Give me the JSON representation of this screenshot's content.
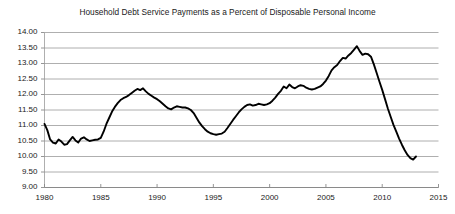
{
  "chart_data": {
    "type": "line",
    "title": "Household Debt Service Payments as a Percent of Disposable Personal Income",
    "xlabel": "",
    "ylabel": "",
    "xlim": [
      1980,
      2015
    ],
    "ylim": [
      9.0,
      14.0
    ],
    "grid": true,
    "legend": "none",
    "yticks": [
      "9.00",
      "9.50",
      "10.00",
      "10.50",
      "11.00",
      "11.50",
      "12.00",
      "12.50",
      "13.00",
      "13.50",
      "14.00"
    ],
    "ytick_values": [
      9.0,
      9.5,
      10.0,
      10.5,
      11.0,
      11.5,
      12.0,
      12.5,
      13.0,
      13.5,
      14.0
    ],
    "xticks": [
      "1980",
      "1985",
      "1990",
      "1995",
      "2000",
      "2005",
      "2010",
      "2015"
    ],
    "xtick_values": [
      1980,
      1985,
      1990,
      1995,
      2000,
      2005,
      2010,
      2015
    ],
    "line_color": "#000000",
    "grid_color": "#9a9a9a",
    "background_color": "#ffffff",
    "series": [
      {
        "name": "Household Debt Service Ratio",
        "x": [
          1980.0,
          1980.25,
          1980.5,
          1980.75,
          1981.0,
          1981.25,
          1981.5,
          1981.75,
          1982.0,
          1982.25,
          1982.5,
          1982.75,
          1983.0,
          1983.25,
          1983.5,
          1983.75,
          1984.0,
          1984.25,
          1984.5,
          1984.75,
          1985.0,
          1985.25,
          1985.5,
          1985.75,
          1986.0,
          1986.25,
          1986.5,
          1986.75,
          1987.0,
          1987.25,
          1987.5,
          1987.75,
          1988.0,
          1988.25,
          1988.5,
          1988.75,
          1989.0,
          1989.25,
          1989.5,
          1989.75,
          1990.0,
          1990.25,
          1990.5,
          1990.75,
          1991.0,
          1991.25,
          1991.5,
          1991.75,
          1992.0,
          1992.25,
          1992.5,
          1992.75,
          1993.0,
          1993.25,
          1993.5,
          1993.75,
          1994.0,
          1994.25,
          1994.5,
          1994.75,
          1995.0,
          1995.25,
          1995.5,
          1995.75,
          1996.0,
          1996.25,
          1996.5,
          1996.75,
          1997.0,
          1997.25,
          1997.5,
          1997.75,
          1998.0,
          1998.25,
          1998.5,
          1998.75,
          1999.0,
          1999.25,
          1999.5,
          1999.75,
          2000.0,
          2000.25,
          2000.5,
          2000.75,
          2001.0,
          2001.25,
          2001.5,
          2001.75,
          2002.0,
          2002.25,
          2002.5,
          2002.75,
          2003.0,
          2003.25,
          2003.5,
          2003.75,
          2004.0,
          2004.25,
          2004.5,
          2004.75,
          2005.0,
          2005.25,
          2005.5,
          2005.75,
          2006.0,
          2006.25,
          2006.5,
          2006.75,
          2007.0,
          2007.25,
          2007.5,
          2007.75,
          2008.0,
          2008.25,
          2008.5,
          2008.75,
          2009.0,
          2009.25,
          2009.5,
          2009.75,
          2010.0,
          2010.25,
          2010.5,
          2010.75,
          2011.0,
          2011.25,
          2011.5,
          2011.75,
          2012.0,
          2012.25,
          2012.5,
          2012.75,
          2013.0
        ],
        "values": [
          11.05,
          10.85,
          10.55,
          10.45,
          10.42,
          10.55,
          10.48,
          10.38,
          10.4,
          10.52,
          10.63,
          10.52,
          10.45,
          10.58,
          10.62,
          10.55,
          10.5,
          10.52,
          10.54,
          10.55,
          10.6,
          10.8,
          11.05,
          11.25,
          11.45,
          11.6,
          11.72,
          11.82,
          11.88,
          11.92,
          11.98,
          12.05,
          12.12,
          12.18,
          12.14,
          12.2,
          12.1,
          12.02,
          11.96,
          11.9,
          11.85,
          11.78,
          11.7,
          11.62,
          11.55,
          11.52,
          11.58,
          11.62,
          11.6,
          11.58,
          11.58,
          11.55,
          11.5,
          11.4,
          11.25,
          11.1,
          10.98,
          10.88,
          10.8,
          10.75,
          10.72,
          10.7,
          10.72,
          10.74,
          10.8,
          10.92,
          11.05,
          11.18,
          11.3,
          11.42,
          11.52,
          11.6,
          11.66,
          11.68,
          11.64,
          11.66,
          11.7,
          11.68,
          11.66,
          11.68,
          11.72,
          11.8,
          11.9,
          12.02,
          12.12,
          12.26,
          12.2,
          12.32,
          12.24,
          12.2,
          12.26,
          12.3,
          12.28,
          12.22,
          12.18,
          12.16,
          12.18,
          12.22,
          12.26,
          12.34,
          12.45,
          12.6,
          12.78,
          12.88,
          12.95,
          13.08,
          13.18,
          13.16,
          13.26,
          13.34,
          13.45,
          13.56,
          13.4,
          13.28,
          13.32,
          13.3,
          13.22,
          12.98,
          12.7,
          12.42,
          12.15,
          11.85,
          11.55,
          11.28,
          11.02,
          10.8,
          10.58,
          10.38,
          10.2,
          10.05,
          9.95,
          9.9,
          10.0
        ]
      }
    ]
  }
}
